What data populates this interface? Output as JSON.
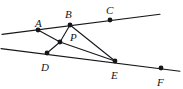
{
  "figure": {
    "kind": "geometry-diagram",
    "width": 183,
    "height": 89,
    "background_color": "#ffffff",
    "stroke_color": "#15161a",
    "label_color": "#15161a",
    "vertex_fill": "#15161a",
    "vertex_radius": 2.4,
    "stroke_width": 1.1
  },
  "points": [
    {
      "id": "A",
      "label": "A",
      "x": 38,
      "y": 30,
      "label_x": 35,
      "label_y": 18
    },
    {
      "id": "B",
      "label": "B",
      "x": 70,
      "y": 25,
      "label_x": 65,
      "label_y": 9
    },
    {
      "id": "C",
      "label": "C",
      "x": 110,
      "y": 20,
      "label_x": 106,
      "label_y": 5
    },
    {
      "id": "P",
      "label": "P",
      "x": 60,
      "y": 42,
      "label_x": 70,
      "label_y": 32
    },
    {
      "id": "D",
      "label": "D",
      "x": 47,
      "y": 53,
      "label_x": 41,
      "label_y": 62
    },
    {
      "id": "E",
      "label": "E",
      "x": 115,
      "y": 61,
      "label_x": 111,
      "label_y": 70
    },
    {
      "id": "F",
      "label": "F",
      "x": 161,
      "y": 68,
      "label_x": 157,
      "label_y": 77
    }
  ],
  "lines": [
    {
      "id": "line-ABC",
      "name": "upper-line-through-A-B-C",
      "x1": 2,
      "y1": 34.4,
      "x2": 160,
      "y2": 14.2
    },
    {
      "id": "line-DEF",
      "name": "lower-line-through-D-E-F",
      "x1": 1,
      "y1": 48.6,
      "x2": 180,
      "y2": 71.2
    }
  ],
  "segments": [
    {
      "id": "seg-AP",
      "name": "segment-A-P",
      "x1": 38,
      "y1": 30,
      "x2": 60,
      "y2": 42
    },
    {
      "id": "seg-BP",
      "name": "segment-B-P",
      "x1": 70,
      "y1": 25,
      "x2": 60,
      "y2": 42
    },
    {
      "id": "seg-PD",
      "name": "segment-P-D",
      "x1": 60,
      "y1": 42,
      "x2": 47,
      "y2": 53
    },
    {
      "id": "seg-PE",
      "name": "segment-P-E",
      "x1": 60,
      "y1": 42,
      "x2": 115,
      "y2": 61
    },
    {
      "id": "seg-BE",
      "name": "segment-B-E",
      "x1": 70,
      "y1": 25,
      "x2": 115,
      "y2": 61
    }
  ]
}
